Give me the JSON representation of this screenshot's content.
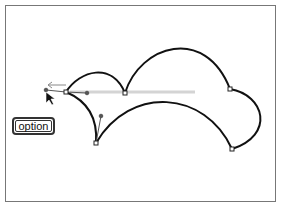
{
  "figure": {
    "modifier_key": {
      "label": "option"
    },
    "colors": {
      "stroke": "#111111",
      "handle": "#555555",
      "guide": "#cccccc",
      "frame": "#777777"
    },
    "anchors": [
      {
        "x": 66,
        "y": 92
      },
      {
        "x": 125,
        "y": 93
      },
      {
        "x": 230,
        "y": 89
      },
      {
        "x": 232,
        "y": 149
      },
      {
        "x": 96,
        "y": 143
      }
    ],
    "handles": [
      {
        "from": [
          66,
          92
        ],
        "to": [
          46,
          90
        ]
      },
      {
        "from": [
          66,
          92
        ],
        "to": [
          87,
          93
        ]
      },
      {
        "from": [
          96,
          143
        ],
        "to": [
          101,
          116
        ]
      }
    ],
    "cursor": {
      "type": "arrow",
      "x": 46,
      "y": 94
    }
  }
}
